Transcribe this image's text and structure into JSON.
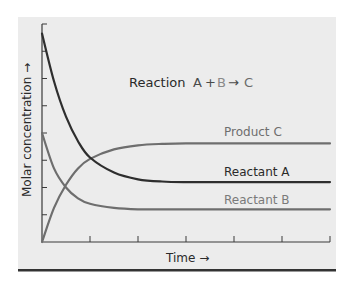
{
  "chart_data": {
    "type": "line",
    "title": "Reaction A + B → C",
    "title_parts": [
      {
        "text": "Reaction",
        "color": "#2a2a2a"
      },
      {
        "text": "A",
        "color": "#4a4a4a"
      },
      {
        "text": "+",
        "color": "#4a4a4a"
      },
      {
        "text": "B",
        "color": "#8a8a8a"
      },
      {
        "text": "→",
        "color": "#4a4a4a"
      },
      {
        "text": "C",
        "color": "#6a6a6a"
      }
    ],
    "xlabel": "Time →",
    "ylabel": "Molar concentration →",
    "xlim": [
      0,
      6
    ],
    "ylim": [
      0,
      8
    ],
    "x_ticks": [
      0,
      1,
      2,
      3,
      4,
      5,
      6
    ],
    "y_ticks": [
      0,
      1,
      2,
      3,
      4,
      5,
      6,
      7,
      8
    ],
    "tick_labels_shown": false,
    "grid": false,
    "legend": "inline labels on curves",
    "series": [
      {
        "name": "Product C",
        "color": "#6e6e6e",
        "label_color": "#6e6e6e",
        "x": [
          0,
          0.25,
          0.5,
          0.75,
          1.0,
          1.5,
          2.0,
          2.5,
          3.0,
          4.0,
          5.0,
          6.0
        ],
        "values": [
          0.0,
          1.25,
          2.1,
          2.7,
          3.05,
          3.4,
          3.55,
          3.6,
          3.62,
          3.62,
          3.62,
          3.62
        ]
      },
      {
        "name": "Reactant A",
        "color": "#2e2e2e",
        "label_color": "#2a2a2a",
        "x": [
          0,
          0.25,
          0.5,
          0.75,
          1.0,
          1.5,
          2.0,
          2.5,
          3.0,
          4.0,
          5.0,
          6.0
        ],
        "values": [
          7.65,
          5.9,
          4.6,
          3.7,
          3.1,
          2.55,
          2.3,
          2.22,
          2.2,
          2.2,
          2.2,
          2.2
        ]
      },
      {
        "name": "Reactant B",
        "color": "#6e6e6e",
        "label_color": "#7a7a7a",
        "x": [
          0,
          0.25,
          0.5,
          0.75,
          1.0,
          1.5,
          2.0,
          2.5,
          3.0,
          4.0,
          5.0,
          6.0
        ],
        "values": [
          4.0,
          2.7,
          2.0,
          1.6,
          1.4,
          1.25,
          1.2,
          1.2,
          1.2,
          1.2,
          1.2,
          1.2
        ]
      }
    ]
  },
  "labels": {
    "title_prefix": "Reaction",
    "equation_A": "A",
    "equation_plus": "+",
    "equation_B": "B",
    "equation_arrow": "→",
    "equation_C": "C",
    "xlabel": "Time →",
    "ylabel": "Molar concentration →",
    "series_C": "Product C",
    "series_A": "Reactant A",
    "series_B": "Reactant B"
  },
  "colors": {
    "panel_background": "#ececec",
    "axis": "#3a3a3a",
    "bottom_rule": "#333333",
    "page_background": "#ffffff"
  }
}
